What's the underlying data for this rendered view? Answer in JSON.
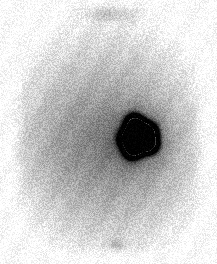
{
  "image": {
    "modality": "nuclear-medicine-scintigraphy",
    "view": "anterior-abdomen",
    "alt_text": "Planar scintigraphy scan of the abdomen showing diffuse grey soft-tissue background with an intense focal area of radiotracer uptake right of midline in the mid-abdomen",
    "width_px": 217,
    "height_px": 264,
    "background_color": "#ffffff",
    "body_color": "#b4b4b4",
    "hotspot_color": "#000000",
    "grain_color": "#808080"
  },
  "scan_field": {
    "margin_left_px": 9,
    "margin_right_px": 9,
    "margin_top_px": 4,
    "margin_bottom_px": 6,
    "body_left_px": 10,
    "body_right_px": 207,
    "body_top_px": 5,
    "body_bottom_px": 258
  },
  "regions": [
    {
      "name": "upper-midline-band",
      "label": "Faint midline structure at top of field of view",
      "center_x": 110,
      "center_y": 13,
      "radius_x": 36,
      "radius_y": 10,
      "intensity": 0.22
    },
    {
      "name": "soft-tissue-background",
      "label": "Diffuse abdominal soft-tissue background activity",
      "center_x": 108,
      "center_y": 140,
      "radius_x": 97,
      "radius_y": 118,
      "intensity": 0.32
    },
    {
      "name": "mid-abdomen-band",
      "label": "Denser mid-abdominal background band",
      "center_x": 108,
      "center_y": 145,
      "radius_x": 92,
      "radius_y": 62,
      "intensity": 0.18
    },
    {
      "name": "focal-hot-spot-halo",
      "label": "Diffuse halo of increased uptake around focal lesion",
      "center_x": 138,
      "center_y": 137,
      "radius_x": 32,
      "radius_y": 33,
      "intensity": 0.45
    },
    {
      "name": "focal-hot-spot-core",
      "label": "Intense focal radiotracer accumulation right of midline",
      "center_x": 138,
      "center_y": 137,
      "radius_x": 17,
      "radius_y": 18,
      "intensity": 1.0
    },
    {
      "name": "lower-midline-focus",
      "label": "Faint lower midline focus (bladder / pelvic activity)",
      "center_x": 118,
      "center_y": 245,
      "radius_x": 12,
      "radius_y": 7,
      "intensity": 0.16
    }
  ],
  "grain": {
    "label": "Film / photon-counting grain noise",
    "amplitude": 26,
    "cell_size_px": 1
  },
  "chart_data": {
    "type": "heatmap",
    "xlabel": "",
    "ylabel": "",
    "colormap": "grayscale-inverted",
    "value_range": [
      0,
      1
    ],
    "annotations": [
      {
        "text": "Focal intense uptake",
        "x": 138,
        "y": 137
      },
      {
        "text": "Faint midline activity",
        "x": 110,
        "y": 13
      },
      {
        "text": "Faint pelvic focus",
        "x": 118,
        "y": 245
      }
    ]
  }
}
